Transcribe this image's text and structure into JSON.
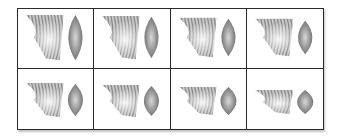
{
  "figure": {
    "rows": 2,
    "columns": 4,
    "panels": [
      {
        "row": 0,
        "col": 0,
        "fan_height": 46,
        "fan_top": 6,
        "lens_height": 46,
        "lens_width": 15
      },
      {
        "row": 0,
        "col": 1,
        "fan_height": 44,
        "fan_top": 7,
        "lens_height": 42,
        "lens_width": 15
      },
      {
        "row": 0,
        "col": 2,
        "fan_height": 40,
        "fan_top": 9,
        "lens_height": 38,
        "lens_width": 15
      },
      {
        "row": 0,
        "col": 3,
        "fan_height": 38,
        "fan_top": 10,
        "lens_height": 34,
        "lens_width": 15
      },
      {
        "row": 1,
        "col": 0,
        "fan_height": 34,
        "fan_top": 14,
        "lens_height": 32,
        "lens_width": 16
      },
      {
        "row": 1,
        "col": 1,
        "fan_height": 32,
        "fan_top": 16,
        "lens_height": 30,
        "lens_width": 16
      },
      {
        "row": 1,
        "col": 2,
        "fan_height": 28,
        "fan_top": 18,
        "lens_height": 28,
        "lens_width": 17
      },
      {
        "row": 1,
        "col": 3,
        "fan_height": 24,
        "fan_top": 21,
        "lens_height": 24,
        "lens_width": 17
      }
    ],
    "colors": {
      "border": "#2a2a2a",
      "stripe_dark": "#8a8a8a",
      "stripe_light": "#c8c8c8",
      "lens_edge": "#6a6a6a",
      "lens_center": "#d8d8d8",
      "background": "#ffffff"
    }
  }
}
